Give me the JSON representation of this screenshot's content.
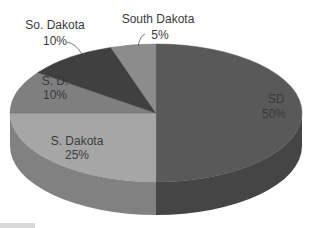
{
  "chart_data": {
    "type": "pie",
    "style": "3d",
    "title": "",
    "categories": [
      "SD",
      "S. Dakota",
      "S. D.",
      "So. Dakota",
      "South Dakota"
    ],
    "values": [
      50,
      25,
      10,
      10,
      5
    ],
    "labels": [
      {
        "name": "SD",
        "pct": "50%"
      },
      {
        "name": "S. Dakota",
        "pct": "25%"
      },
      {
        "name": "S. D.",
        "pct": "10%"
      },
      {
        "name": "So. Dakota",
        "pct": "10%"
      },
      {
        "name": "South Dakota",
        "pct": "5%"
      }
    ],
    "colors": {
      "SD": "#595959",
      "S. Dakota": "#a6a6a6",
      "S. D.": "#7f7f7f",
      "So. Dakota": "#404040",
      "South Dakota": "#8c8c8c"
    },
    "legend": "none",
    "data_labels": "category name and percentage"
  }
}
